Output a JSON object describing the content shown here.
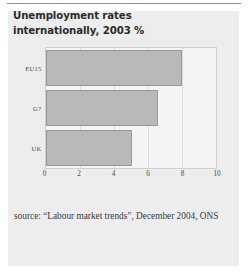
{
  "figure": {
    "title": "Unemployment rates internationally, 2003 %",
    "source": "source: “Labour market trends”, December 2004, ONS",
    "panel_color": "#ededed",
    "bar_color": "#b9b9b9",
    "bar_border_color": "#9a9a9a",
    "grid_color": "#dcdcdc",
    "text_color": "#2b2b2b"
  },
  "chart_data": {
    "type": "bar",
    "orientation": "horizontal",
    "title": "Unemployment rates internationally, 2003 %",
    "xlabel": "",
    "ylabel": "",
    "categories": [
      "EU15",
      "G7",
      "UK"
    ],
    "values": [
      8.0,
      6.6,
      5.1
    ],
    "series": [
      {
        "name": "Unemployment rate 2003 (%)",
        "values": [
          8.0,
          6.6,
          5.1
        ]
      }
    ],
    "xlim": [
      0,
      10
    ],
    "xticks": [
      0,
      2,
      4,
      6,
      8,
      10
    ],
    "xtick_labels": [
      "0",
      "2",
      "4",
      "6",
      "8",
      "10"
    ],
    "grid": true,
    "grid_axis": "x",
    "legend": false,
    "annotations": [
      "source: “Labour market trends”, December 2004, ONS"
    ]
  }
}
